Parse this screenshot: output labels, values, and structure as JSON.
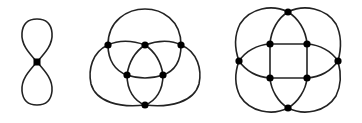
{
  "diagram": {
    "colors": {
      "edge": "#222222",
      "node": "#000000",
      "background": "#ffffff"
    },
    "figures": [
      {
        "id": "figure-eight",
        "node_count": 1,
        "nodes": [
          [
            37,
            62
          ]
        ]
      },
      {
        "id": "three-circles",
        "node_count": 6,
        "nodes": [
          [
            108,
            45
          ],
          [
            145,
            45
          ],
          [
            181,
            45
          ],
          [
            127,
            75
          ],
          [
            163,
            75
          ],
          [
            145,
            105
          ]
        ]
      },
      {
        "id": "four-circles-square",
        "node_count": 8,
        "nodes": [
          [
            288,
            12
          ],
          [
            270,
            44
          ],
          [
            307,
            44
          ],
          [
            239,
            61
          ],
          [
            338,
            61
          ],
          [
            270,
            78
          ],
          [
            307,
            78
          ],
          [
            288,
            108
          ]
        ]
      }
    ]
  }
}
